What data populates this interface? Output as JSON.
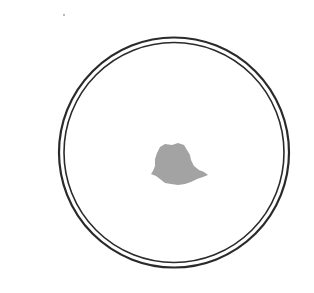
{
  "figure": {
    "ring_color": "#2a2a2a",
    "fill_color": "#a3a3a3",
    "background_color": "#ffffff"
  }
}
